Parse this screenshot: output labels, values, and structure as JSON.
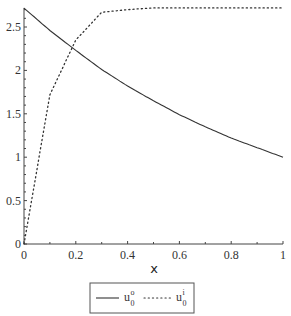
{
  "chart_data": {
    "type": "line",
    "title": "",
    "xlabel": "x",
    "ylabel": "",
    "xlim": [
      0,
      1
    ],
    "ylim": [
      0,
      2.72
    ],
    "grid": false,
    "legend_position": "bottom",
    "x_ticks": [
      "0",
      "0.2",
      "0.4",
      "0.6",
      "0.8",
      "1"
    ],
    "y_ticks": [
      "0",
      "0.5",
      "1",
      "1.5",
      "2",
      "2.5"
    ],
    "x": [
      0,
      0.1,
      0.2,
      0.3,
      0.4,
      0.5,
      0.6,
      0.7,
      0.8,
      0.9,
      1.0
    ],
    "series": [
      {
        "name": "u_0^o",
        "style": "solid",
        "values": [
          2.718,
          2.46,
          2.23,
          2.01,
          1.82,
          1.65,
          1.49,
          1.35,
          1.22,
          1.11,
          1.0
        ]
      },
      {
        "name": "u_0^i",
        "style": "dotted",
        "values": [
          0.0,
          1.72,
          2.35,
          2.67,
          2.7,
          2.72,
          2.72,
          2.72,
          2.72,
          2.72,
          2.72
        ]
      }
    ]
  },
  "legend": {
    "items": [
      {
        "base": "u",
        "sup": "o",
        "sub": "0",
        "style": "solid"
      },
      {
        "base": "u",
        "sup": "i",
        "sub": "0",
        "style": "dotted"
      }
    ]
  },
  "colors": {
    "line": "#333333",
    "axis": "#444444"
  }
}
